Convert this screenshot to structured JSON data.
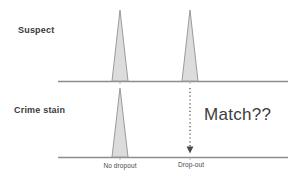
{
  "figure": {
    "width": 299,
    "height": 179,
    "background_color": "#ffffff",
    "panels": [
      {
        "id": "suspect",
        "label": "Suspect",
        "baseline_y": 81,
        "axis_x_start": 58,
        "axis_x_end": 288
      },
      {
        "id": "crime-stain",
        "label": "Crime stain",
        "baseline_y": 157,
        "axis_x_start": 58,
        "axis_x_end": 288
      }
    ],
    "axis_labels": [
      {
        "id": "no-dropout",
        "text": "No dropout",
        "center_x": 120
      },
      {
        "id": "drop-out",
        "text": "Drop-out",
        "center_x": 190
      }
    ],
    "annotation": {
      "text": "Match??",
      "x": 204,
      "y": 106
    },
    "arrow": {
      "name": "dropout-arrow",
      "x": 190,
      "y_start": 88,
      "y_end": 152,
      "style": "dotted",
      "head": "down",
      "color": "#555555"
    },
    "colors": {
      "peak_fill": "#dcdcdc",
      "peak_stroke": "#9a9a9a",
      "axis_line": "#8d8d8d",
      "text": "#2b2b2b",
      "arrow": "#555555"
    }
  },
  "chart_data": {
    "type": "area",
    "title": "",
    "subtitle": "",
    "xlabel": "",
    "ylabel": "",
    "grid": false,
    "legend_position": "none",
    "xlim": [
      58,
      288
    ],
    "categories": [
      "No dropout",
      "Drop-out"
    ],
    "locus_positions_px": [
      120,
      190
    ],
    "series": [
      {
        "name": "Suspect",
        "values": [
          1.0,
          1.0
        ],
        "peaks": [
          {
            "locus": "No dropout",
            "center_x": 120,
            "half_width": 8,
            "apex_y": 10,
            "base_y": 81,
            "height": 71,
            "present": true
          },
          {
            "locus": "Drop-out",
            "center_x": 190,
            "half_width": 8,
            "apex_y": 10,
            "base_y": 81,
            "height": 71,
            "present": true
          }
        ]
      },
      {
        "name": "Crime stain",
        "values": [
          1.0,
          0.0
        ],
        "peaks": [
          {
            "locus": "No dropout",
            "center_x": 120,
            "half_width": 8,
            "apex_y": 88,
            "base_y": 157,
            "height": 69,
            "present": true
          },
          {
            "locus": "Drop-out",
            "center_x": 190,
            "half_width": 8,
            "apex_y": 157,
            "base_y": 157,
            "height": 0,
            "present": false
          }
        ]
      }
    ],
    "annotations": [
      {
        "text": "Match??",
        "x": 204,
        "y": 106
      }
    ]
  }
}
